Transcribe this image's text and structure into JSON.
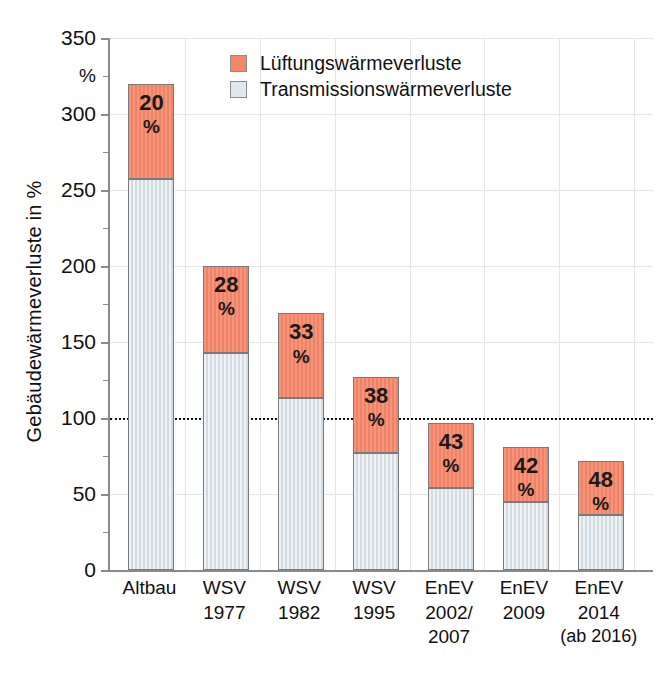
{
  "chart_data": {
    "type": "bar",
    "title": "",
    "subtitle": "",
    "xlabel": "",
    "ylabel": "Gebäudewärmeverluste in %",
    "ylim": [
      0,
      350
    ],
    "yticks": [
      0,
      50,
      100,
      150,
      200,
      250,
      300,
      350
    ],
    "ytick_labels": [
      "0",
      "50",
      "100",
      "150",
      "200",
      "250",
      "300",
      "350"
    ],
    "y_unit_label": "%",
    "grid": true,
    "stacked": true,
    "legend_position": "top-center",
    "reference_line": {
      "value": 100,
      "style": "dotted",
      "label": ""
    },
    "categories": [
      "Altbau",
      "WSV 1977",
      "WSV 1982",
      "WSV 1995",
      "EnEV 2002/2007",
      "EnEV 2009",
      "EnEV 2014 (ab 2016)"
    ],
    "series": [
      {
        "name": "Transmissionswärmeverluste",
        "color": "#dde4ea",
        "values": [
          257,
          143,
          113,
          77,
          54,
          45,
          36
        ]
      },
      {
        "name": "Lüftungswärmeverluste",
        "color": "#f4866a",
        "values": [
          63,
          57,
          56,
          50,
          43,
          36,
          36
        ]
      }
    ],
    "totals": [
      320,
      200,
      169,
      127,
      97,
      81,
      72
    ],
    "bar_labels": [
      "20 %",
      "28 %",
      "33 %",
      "38 %",
      "43 %",
      "42 %",
      "48 %"
    ],
    "bar_label_values": [
      20,
      28,
      33,
      38,
      43,
      42,
      48
    ],
    "bar_label_unit": "%"
  },
  "axis": {
    "y_title": "Gebäudewärmeverluste in %",
    "y_unit": "%",
    "ticks": [
      {
        "value": 350,
        "label": "350"
      },
      {
        "value": 300,
        "label": "300"
      },
      {
        "value": 250,
        "label": "250"
      },
      {
        "value": 200,
        "label": "200"
      },
      {
        "value": 150,
        "label": "150"
      },
      {
        "value": 100,
        "label": "100"
      },
      {
        "value": 50,
        "label": "50"
      },
      {
        "value": 0,
        "label": "0"
      }
    ]
  },
  "legend": {
    "items": [
      {
        "label": "Lüftungswärmeverluste",
        "color": "#f4866a",
        "swatch": "legend-swatch-luftung"
      },
      {
        "label": "Transmissionswärmeverluste",
        "color": "#e2e8ee",
        "swatch": "legend-swatch-transmission"
      }
    ]
  },
  "bars": [
    {
      "name": "altbau",
      "label_lines": [
        "Altbau"
      ],
      "pct": "20",
      "unit": "%",
      "total": 320,
      "trans": 257,
      "luft": 63
    },
    {
      "name": "wsv-1977",
      "label_lines": [
        "WSV",
        "1977"
      ],
      "pct": "28",
      "unit": "%",
      "total": 200,
      "trans": 143,
      "luft": 57
    },
    {
      "name": "wsv-1982",
      "label_lines": [
        "WSV",
        "1982"
      ],
      "pct": "33",
      "unit": "%",
      "total": 169,
      "trans": 113,
      "luft": 56
    },
    {
      "name": "wsv-1995",
      "label_lines": [
        "WSV",
        "1995"
      ],
      "pct": "38",
      "unit": "%",
      "total": 127,
      "trans": 77,
      "luft": 50
    },
    {
      "name": "enev-2002",
      "label_lines": [
        "EnEV",
        "2002/",
        "2007"
      ],
      "pct": "43",
      "unit": "%",
      "total": 97,
      "trans": 54,
      "luft": 43
    },
    {
      "name": "enev-2009",
      "label_lines": [
        "EnEV",
        "2009"
      ],
      "pct": "42",
      "unit": "%",
      "total": 81,
      "trans": 45,
      "luft": 36
    },
    {
      "name": "enev-2014",
      "label_lines": [
        "EnEV",
        "2014",
        "(ab 2016)"
      ],
      "pct": "48",
      "unit": "%",
      "total": 72,
      "trans": 36,
      "luft": 36
    }
  ]
}
